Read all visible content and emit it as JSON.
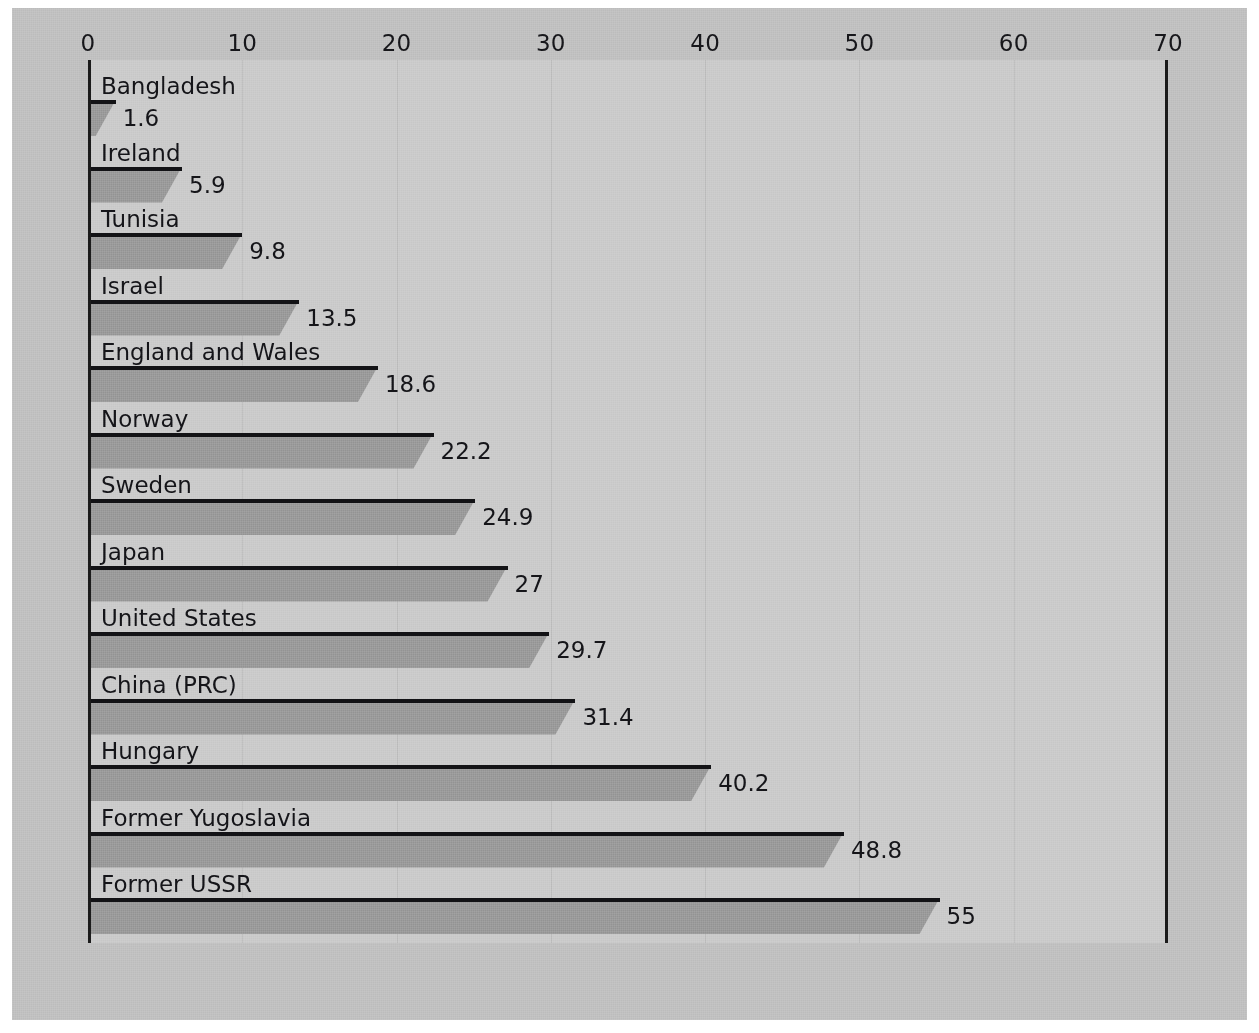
{
  "chart_data": {
    "type": "bar",
    "orientation": "horizontal",
    "title": "",
    "subtitle": "",
    "xlabel": "",
    "ylabel": "",
    "xlim": [
      0,
      70
    ],
    "ylim": null,
    "grid": true,
    "legend": null,
    "legend_position": "none",
    "x_ticks": [
      0,
      10,
      20,
      30,
      40,
      50,
      60,
      70
    ],
    "x_tick_labels": [
      "0",
      "10",
      "20",
      "30",
      "40",
      "50",
      "60",
      "70"
    ],
    "categories": [
      "Bangladesh",
      "Ireland",
      "Tunisia",
      "Israel",
      "England and Wales",
      "Norway",
      "Sweden",
      "Japan",
      "United States",
      "China (PRC)",
      "Hungary",
      "Former Yugoslavia",
      "Former USSR"
    ],
    "values": [
      1.6,
      5.9,
      9.8,
      13.5,
      18.6,
      22.2,
      24.9,
      27,
      29.7,
      31.4,
      40.2,
      48.8,
      55
    ],
    "value_labels": [
      "1.6",
      "5.9",
      "9.8",
      "13.5",
      "18.6",
      "22.2",
      "24.9",
      "27",
      "29.7",
      "31.4",
      "40.2",
      "48.8",
      "55"
    ],
    "annotations": []
  },
  "colors": {
    "figure_background": "#c0c0c0",
    "plot_background": "#cacaca",
    "bar_fill": "#999999",
    "bar_top_edge": "#121215",
    "axis_line": "#1a1a1a",
    "gridline": "#bdbdbd",
    "text": "#141418"
  }
}
